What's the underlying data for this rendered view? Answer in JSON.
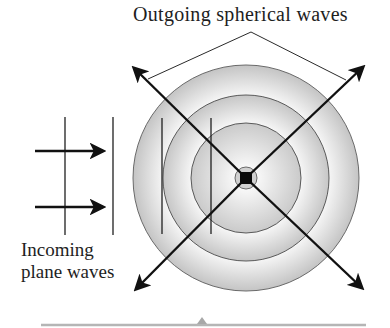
{
  "diagram": {
    "title": "Outgoing spherical waves",
    "incoming_label_line1": "Incoming",
    "incoming_label_line2": "plane waves",
    "colors": {
      "ink": "#1a1a1a",
      "ring_fill_outer": "#c8c8c8",
      "ring_fill_inner": "#f4f4f4",
      "bottom_bar": "#b0b0b0"
    },
    "center": [
      246,
      178
    ],
    "ring_radii": [
      113,
      83,
      55,
      11
    ],
    "incoming_wavefront_x": [
      65,
      113,
      162,
      211
    ],
    "incoming_arrow_y": [
      151,
      207
    ],
    "outgoing_arrows": [
      "up-left",
      "up-right",
      "down-left",
      "down-right"
    ]
  }
}
